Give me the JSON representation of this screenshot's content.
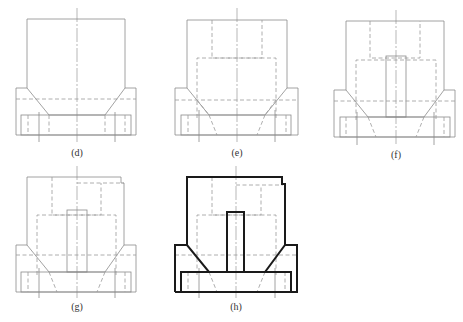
{
  "figure": {
    "panels": [
      {
        "id": "d",
        "label": "(d)"
      },
      {
        "id": "e",
        "label": "(e)"
      },
      {
        "id": "f",
        "label": "(f)"
      },
      {
        "id": "g",
        "label": "(g)"
      },
      {
        "id": "h",
        "label": "(h)"
      }
    ]
  }
}
